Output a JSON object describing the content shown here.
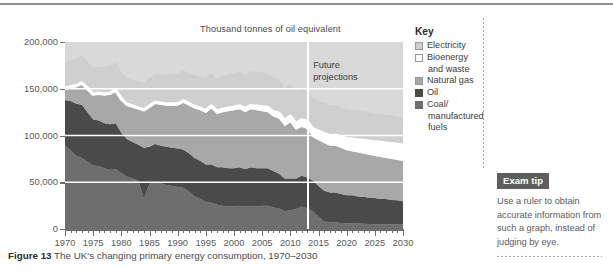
{
  "figure": {
    "label": "Figure 13",
    "caption": "The UK's changing primary energy consumption, 1970–2030"
  },
  "key": {
    "title": "Key",
    "items": [
      {
        "label": "Electricity",
        "color": "#cfcfcf"
      },
      {
        "label": "Bioenergy",
        "label2": "and waste",
        "color": "#ffffff"
      },
      {
        "label": "Natural gas",
        "color": "#a8a8a8"
      },
      {
        "label": "Oil",
        "color": "#4a4a4a"
      },
      {
        "label": "Coal/",
        "label2": "manufactured",
        "label3": "fuels",
        "color": "#6e6e6e"
      }
    ]
  },
  "exam_tip": {
    "badge": "Exam tip",
    "text": "Use a ruler to obtain accurate information from such a graph, instead of judging by eye."
  },
  "annotations": {
    "future_line1": "Future",
    "future_line2": "projections"
  },
  "chart_data": {
    "type": "area",
    "title": "The UK's changing primary energy consumption, 1970–2030",
    "subtitle": "Thousand tonnes of oil equivalent",
    "xlabel": "",
    "ylabel": "Thousand tonnes of oil equivalent",
    "stacked": true,
    "grid": true,
    "legend_position": "right",
    "xlim": [
      1970,
      2030
    ],
    "ylim": [
      0,
      200000
    ],
    "ytick_labels": [
      "0",
      "50,000",
      "100,000",
      "150,000",
      "200,000"
    ],
    "yticks": [
      0,
      50000,
      100000,
      150000,
      200000
    ],
    "xtick_labels": [
      "1970",
      "1975",
      "1980",
      "1985",
      "1990",
      "1995",
      "2000",
      "2005",
      "2010",
      "2015",
      "2020",
      "2025",
      "2030"
    ],
    "xticks": [
      1970,
      1975,
      1980,
      1985,
      1990,
      1995,
      2000,
      2005,
      2010,
      2015,
      2020,
      2025,
      2030
    ],
    "minor_tick_interval": 1,
    "projection_start_year": 2013,
    "projection_note": "Future projections",
    "x": [
      1970,
      1971,
      1972,
      1973,
      1974,
      1975,
      1976,
      1977,
      1978,
      1979,
      1980,
      1981,
      1982,
      1983,
      1984,
      1985,
      1986,
      1987,
      1988,
      1989,
      1990,
      1991,
      1992,
      1993,
      1994,
      1995,
      1996,
      1997,
      1998,
      1999,
      2000,
      2001,
      2002,
      2003,
      2004,
      2005,
      2006,
      2007,
      2008,
      2009,
      2010,
      2011,
      2012,
      2013,
      2014,
      2015,
      2016,
      2017,
      2018,
      2019,
      2020,
      2021,
      2022,
      2023,
      2024,
      2025,
      2026,
      2027,
      2028,
      2029,
      2030
    ],
    "series": [
      {
        "name": "Coal/manufactured fuels",
        "color": "#6e6e6e",
        "values": [
          89000,
          84000,
          78000,
          76000,
          72000,
          68000,
          67000,
          65000,
          63000,
          64000,
          60000,
          56000,
          54000,
          52000,
          32000,
          48000,
          50000,
          49000,
          47000,
          46000,
          45000,
          44000,
          40000,
          35000,
          32000,
          29000,
          28000,
          26000,
          25000,
          24000,
          24000,
          25000,
          24000,
          25000,
          24000,
          25000,
          25000,
          23000,
          22000,
          19000,
          20000,
          21000,
          24000,
          22000,
          19000,
          13000,
          8000,
          7000,
          7000,
          6500,
          6200,
          6000,
          5800,
          5600,
          5400,
          5200,
          5100,
          5000,
          4900,
          4800,
          4700
        ]
      },
      {
        "name": "Oil",
        "color": "#4a4a4a",
        "values": [
          49000,
          53000,
          56000,
          57000,
          53000,
          49000,
          49000,
          48000,
          49000,
          49000,
          43000,
          40000,
          39000,
          38000,
          55000,
          40000,
          41000,
          40000,
          41000,
          41000,
          41000,
          41000,
          41000,
          41000,
          41000,
          40000,
          41000,
          40000,
          41000,
          41000,
          41000,
          41000,
          40000,
          41000,
          41000,
          40000,
          40000,
          39000,
          37000,
          35000,
          34000,
          33000,
          33000,
          33000,
          33000,
          33000,
          33000,
          32000,
          32000,
          31000,
          30000,
          30000,
          29000,
          29000,
          28000,
          28000,
          27000,
          27000,
          26000,
          26000,
          25000
        ]
      },
      {
        "name": "Natural gas",
        "color": "#a8a8a8",
        "values": [
          11000,
          14000,
          18000,
          22000,
          24000,
          26000,
          28000,
          30000,
          32000,
          34000,
          35000,
          36000,
          37000,
          38000,
          39000,
          42000,
          43000,
          44000,
          44000,
          45000,
          46000,
          50000,
          51000,
          53000,
          54000,
          55000,
          60000,
          57000,
          59000,
          61000,
          62000,
          62000,
          61000,
          62000,
          62000,
          61000,
          60000,
          58000,
          59000,
          56000,
          60000,
          52000,
          52000,
          52000,
          46000,
          49000,
          51000,
          50000,
          50000,
          49000,
          48000,
          47000,
          47000,
          46000,
          46000,
          45000,
          45000,
          44000,
          44000,
          43000,
          43000
        ]
      },
      {
        "name": "Bioenergy and waste",
        "color": "#ffffff",
        "values": [
          1200,
          1200,
          1200,
          1200,
          1200,
          1200,
          1200,
          1300,
          1300,
          1300,
          1300,
          1300,
          1400,
          1400,
          1400,
          1500,
          1500,
          1600,
          1600,
          1700,
          1800,
          1900,
          2000,
          2100,
          2200,
          2400,
          2600,
          2800,
          3000,
          3200,
          3400,
          3600,
          3800,
          4000,
          4300,
          4600,
          4900,
          5200,
          5600,
          6000,
          6500,
          7000,
          7600,
          8200,
          8800,
          9400,
          10000,
          10600,
          11200,
          11800,
          12400,
          13000,
          13500,
          14000,
          14500,
          15000,
          15400,
          15800,
          16200,
          16600,
          17000
        ]
      },
      {
        "name": "Electricity",
        "color": "#cfcfcf",
        "values": [
          28000,
          28500,
          29000,
          30000,
          29000,
          28000,
          28500,
          29000,
          29500,
          30000,
          29000,
          28500,
          28000,
          28500,
          29000,
          30000,
          30500,
          31000,
          31500,
          32000,
          32500,
          33000,
          33000,
          33500,
          34000,
          34500,
          35000,
          35000,
          35500,
          36000,
          36500,
          36500,
          36500,
          37000,
          37000,
          37000,
          36500,
          36500,
          36000,
          34000,
          35000,
          34000,
          34000,
          34000,
          33000,
          33000,
          33000,
          32500,
          32500,
          32000,
          32000,
          31500,
          31500,
          31000,
          31000,
          30500,
          30500,
          30000,
          30000,
          29500,
          29500
        ]
      }
    ],
    "highlight_line": {
      "name": "total boundary (white)",
      "color": "#ffffff",
      "description": "thick white band marking top of Bioenergy and waste layer"
    }
  }
}
